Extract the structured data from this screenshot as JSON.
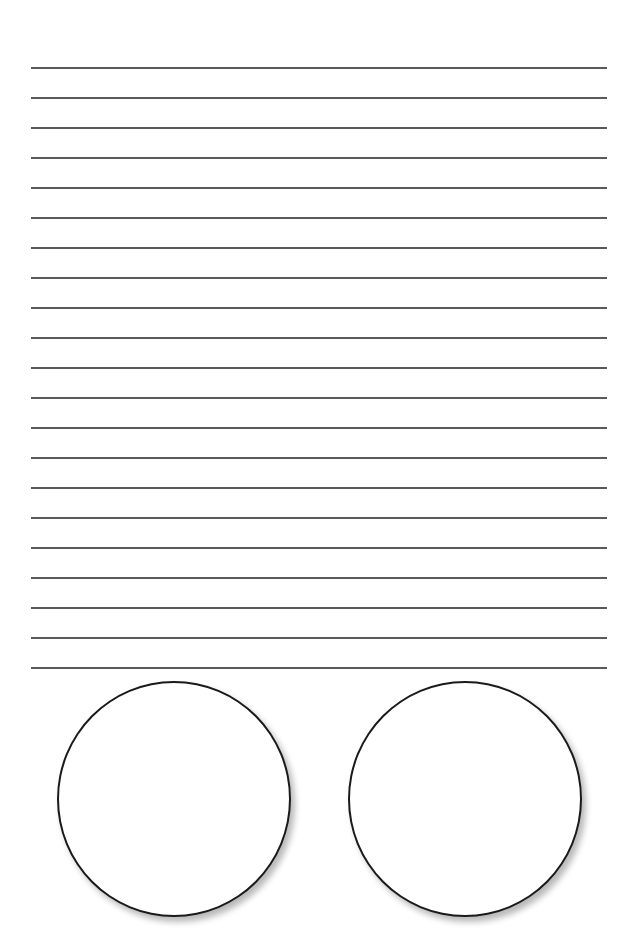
{
  "page": {
    "background": "#ffffff",
    "line_color": "#3c3c3c",
    "circle_stroke": "#1a1a1a"
  },
  "ruled_lines": {
    "count": 21,
    "first_y": 68,
    "spacing": 30,
    "x_start": 31,
    "x_end": 607
  },
  "circles": [
    {
      "cx": 174,
      "cy": 798,
      "r": 117
    },
    {
      "cx": 465,
      "cy": 798,
      "r": 117
    }
  ]
}
